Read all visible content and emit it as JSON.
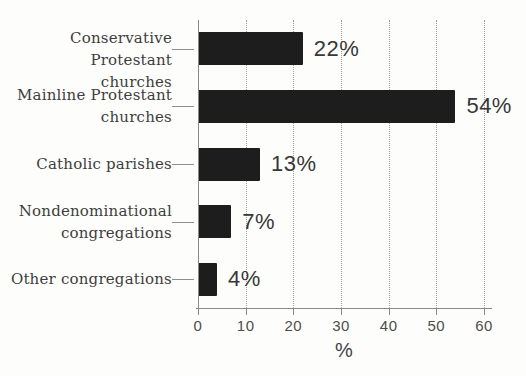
{
  "chart_data": {
    "type": "bar",
    "orientation": "horizontal",
    "title": "",
    "categories": [
      "Conservative Protestant churches",
      "Mainline Protestant churches",
      "Catholic parishes",
      "Nondenominational congregations",
      "Other congregations"
    ],
    "category_lines": [
      "Conservative Protestant\nchurches",
      "Mainline Protestant\nchurches",
      "Catholic parishes",
      "Nondenominational\ncongregations",
      "Other congregations"
    ],
    "values": [
      22,
      54,
      13,
      7,
      4
    ],
    "data_labels": [
      "22%",
      "54%",
      "13%",
      "7%",
      "4%"
    ],
    "xlabel": "%",
    "xticks": [
      0,
      10,
      20,
      30,
      40,
      50,
      60
    ],
    "xtick_labels": [
      "0",
      "10",
      "20",
      "30",
      "40",
      "50",
      "60"
    ],
    "xlim": [
      0,
      60
    ],
    "grid": "dotted-vertical",
    "legend": "none",
    "bar_color": "#1d1d1d",
    "background_color": "#fdfdfb",
    "axis_color": "#8a8a8a",
    "grid_color": "#9e9e9e",
    "category_label_color": "#3e3e3e",
    "data_label_color": "#383838",
    "tick_label_color": "#4d4d4d"
  }
}
